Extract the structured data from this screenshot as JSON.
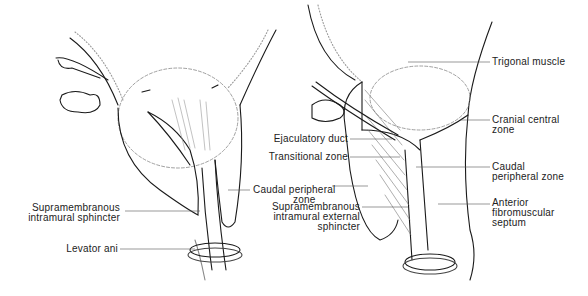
{
  "left_figure": {
    "labels": {
      "caudal_peripheral_zone": [
        "Caudal peripheral",
        "zone"
      ],
      "supramembranous_sphincter": [
        "Supramembranous",
        "intramural sphincter"
      ],
      "levator_ani": "Levator ani"
    }
  },
  "right_figure": {
    "labels": {
      "trigonal_muscle": "Trigonal muscle",
      "cranial_central_zone": [
        "Cranial central",
        "zone"
      ],
      "ejaculatory_duct": "Ejaculatory duct",
      "transitional_zone": "Transitional zone",
      "caudal_peripheral_zone": [
        "Caudal",
        "peripheral zone"
      ],
      "anterior_fibromuscular_septum": [
        "Anterior",
        "fibromuscular",
        "septum"
      ],
      "supramembranous_external_sphincter": [
        "Supramembranous",
        "intramural external",
        "sphincter"
      ]
    }
  },
  "colors": {
    "line": "#1a1a1a",
    "thin_line": "#777777",
    "background": "#ffffff"
  }
}
